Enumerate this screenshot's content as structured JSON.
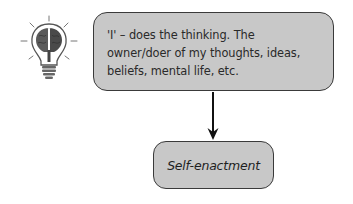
{
  "diagram": {
    "icon": "brain-lightbulb-icon",
    "top_box": {
      "text": "'I' – does the thinking. The owner/doer of my thoughts, ideas, beliefs, mental life, etc."
    },
    "connector": "arrow-down",
    "bottom_box": {
      "text": "Self-enactment"
    },
    "colors": {
      "box_fill": "#c8c8c8",
      "box_border": "#3a3a3a",
      "arrow": "#111111",
      "text": "#2a2a2a"
    }
  }
}
